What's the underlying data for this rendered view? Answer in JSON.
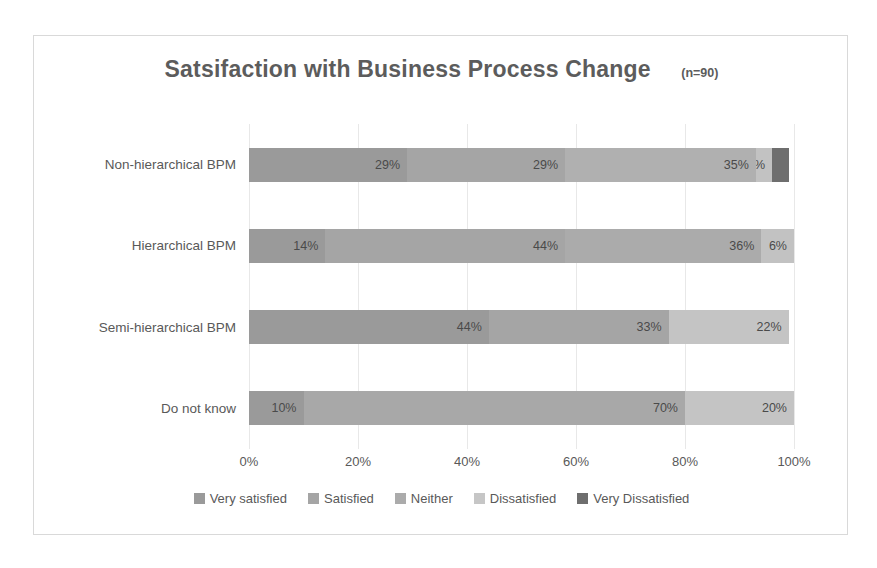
{
  "chart_data": {
    "type": "bar",
    "subtype": "stacked-horizontal-100",
    "title": "Satsifaction with Business Process  Change",
    "annotation": "(n=90)",
    "xlabel": "",
    "ylabel": "",
    "xlim": [
      0,
      100
    ],
    "xticks": [
      "0%",
      "20%",
      "40%",
      "60%",
      "80%",
      "100%"
    ],
    "xtick_values": [
      0,
      20,
      40,
      60,
      80,
      100
    ],
    "grid": true,
    "legend_position": "bottom",
    "categories": [
      "Non-hierarchical BPM",
      "Hierarchical BPM",
      "Semi-hierarchical BPM",
      "Do not know"
    ],
    "series": [
      {
        "name": "Very satisfied",
        "color": "#9a9a9a",
        "values": [
          29,
          14,
          44,
          10
        ]
      },
      {
        "name": "Satisfied",
        "color": "#a5a5a5",
        "values": [
          29,
          44,
          33,
          70
        ]
      },
      {
        "name": "Neither",
        "color": "#9e9e9e",
        "values": [
          35,
          36,
          0,
          0
        ]
      },
      {
        "name": "Dissatisfied",
        "color": "#c2c2c2",
        "values": [
          3,
          6,
          22,
          20
        ]
      },
      {
        "name": "Very Dissatisfied",
        "color": "#6e6e6e",
        "values": [
          3,
          0,
          0,
          0
        ]
      }
    ],
    "rows": [
      {
        "label": "Non-hierarchical BPM",
        "segments": [
          {
            "series": "Very satisfied",
            "value": 29,
            "label": "29%",
            "color": "#9a9a9a",
            "label_position": "inside"
          },
          {
            "series": "Satisfied",
            "value": 29,
            "label": "29%",
            "color": "#a5a5a5",
            "label_position": "inside"
          },
          {
            "series": "Neither",
            "value": 35,
            "label": "35%",
            "color": "#b0b0b0",
            "label_position": "inside"
          },
          {
            "series": "Dissatisfied",
            "value": 3,
            "label": "3%",
            "color": "#c2c2c2",
            "label_position": "inside"
          },
          {
            "series": "Very Dissatisfied",
            "value": 3,
            "label": "3%",
            "color": "#6e6e6e",
            "label_position": "outside"
          }
        ]
      },
      {
        "label": "Hierarchical BPM",
        "segments": [
          {
            "series": "Very satisfied",
            "value": 14,
            "label": "14%",
            "color": "#9a9a9a",
            "label_position": "inside"
          },
          {
            "series": "Satisfied",
            "value": 44,
            "label": "44%",
            "color": "#a5a5a5",
            "label_position": "inside"
          },
          {
            "series": "Neither",
            "value": 36,
            "label": "36%",
            "color": "#ababab",
            "label_position": "inside"
          },
          {
            "series": "Dissatisfied",
            "value": 6,
            "label": "6%",
            "color": "#c2c2c2",
            "label_position": "inside"
          }
        ]
      },
      {
        "label": "Semi-hierarchical BPM",
        "segments": [
          {
            "series": "Very satisfied",
            "value": 44,
            "label": "44%",
            "color": "#9a9a9a",
            "label_position": "inside"
          },
          {
            "series": "Satisfied",
            "value": 33,
            "label": "33%",
            "color": "#a5a5a5",
            "label_position": "inside"
          },
          {
            "series": "Dissatisfied",
            "value": 22,
            "label": "22%",
            "color": "#c4c4c4",
            "label_position": "inside"
          }
        ]
      },
      {
        "label": "Do not know",
        "segments": [
          {
            "series": "Very satisfied",
            "value": 10,
            "label": "10%",
            "color": "#9a9a9a",
            "label_position": "inside"
          },
          {
            "series": "Satisfied",
            "value": 70,
            "label": "70%",
            "color": "#a8a8a8",
            "label_position": "inside"
          },
          {
            "series": "Dissatisfied",
            "value": 20,
            "label": "20%",
            "color": "#c4c4c4",
            "label_position": "inside"
          }
        ]
      }
    ],
    "legend": [
      {
        "label": "Very satisfied",
        "color": "#9a9a9a"
      },
      {
        "label": "Satisfied",
        "color": "#a5a5a5"
      },
      {
        "label": "Neither",
        "color": "#ababab"
      },
      {
        "label": "Dissatisfied",
        "color": "#c6c6c6"
      },
      {
        "label": "Very Dissatisfied",
        "color": "#6e6e6e"
      }
    ]
  },
  "style": {
    "frame_border_color": "#d9d9d9",
    "gridline_color": "#e8e8e8",
    "text_color": "#595959",
    "background": "#ffffff"
  }
}
